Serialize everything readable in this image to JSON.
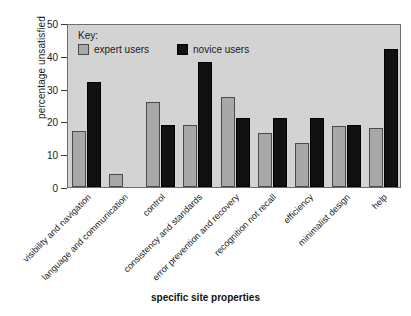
{
  "chart_data": {
    "type": "bar",
    "title": "",
    "xlabel": "specific site properties",
    "ylabel": "percentage unsatisfied",
    "ylim": [
      0,
      50
    ],
    "yticks": [
      0,
      10,
      20,
      30,
      40,
      50
    ],
    "grid": false,
    "legend_position": "top-left-inside",
    "legend_title": "Key:",
    "categories": [
      "visibility and navigation",
      "language and communication",
      "control",
      "consistency and standards",
      "error prevention and recovery",
      "recognition not recall",
      "efficiency",
      "minimalist design",
      "help"
    ],
    "series": [
      {
        "name": "expert users",
        "color": "#a8a8a8",
        "values": [
          17,
          4,
          26,
          19,
          27.5,
          16.5,
          13.5,
          18.5,
          18
        ]
      },
      {
        "name": "novice users",
        "color": "#111111",
        "values": [
          32,
          0,
          19,
          38,
          21,
          21,
          21,
          19,
          42
        ]
      }
    ]
  },
  "axis": {
    "y_title": "percentage unsatisfied",
    "x_title": "specific site properties",
    "y_tick_labels": [
      "0",
      "10",
      "20",
      "30",
      "40",
      "50"
    ]
  },
  "legend": {
    "title": "Key:",
    "entries": [
      {
        "label": "expert users"
      },
      {
        "label": "novice users"
      }
    ]
  }
}
